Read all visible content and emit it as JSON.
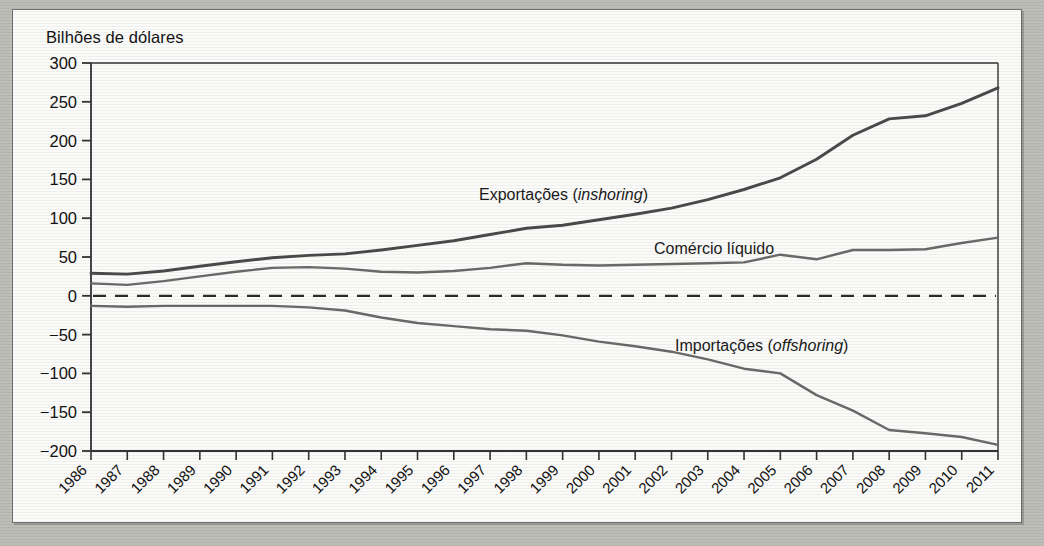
{
  "figure": {
    "axis_title": "Bilhões de dólares",
    "line_color_primary": "#4a4a4a",
    "line_color_secondary": "#6a6a6a",
    "axis_color": "#333333",
    "page_background": "#fbfbf9",
    "frame_background": "#bdbdb8"
  },
  "series_labels": [
    {
      "name": "exports",
      "text_main": "Exportações (",
      "text_italic": "inshoring",
      "text_tail": ")",
      "x": 466,
      "y": 190
    },
    {
      "name": "net-trade",
      "text_main": "Comércio líquido",
      "text_italic": "",
      "text_tail": "",
      "x": 641,
      "y": 244
    },
    {
      "name": "imports",
      "text_main": "Importações (",
      "text_italic": "offshoring",
      "text_tail": ")",
      "x": 662,
      "y": 341
    }
  ],
  "chart_data": {
    "type": "line",
    "title": "Bilhões de dólares",
    "xlabel": "",
    "ylabel": "Bilhões de dólares",
    "ylim": [
      -200,
      300
    ],
    "ytick_step": 50,
    "yticks": [
      "300",
      "250",
      "200",
      "150",
      "100",
      "50",
      "0",
      "−50",
      "−100",
      "−150",
      "−200"
    ],
    "grid": false,
    "legend": "inline-annotations",
    "zero_line": {
      "value": 0,
      "style": "dashed"
    },
    "categories": [
      "1986",
      "1987",
      "1988",
      "1989",
      "1990",
      "1991",
      "1992",
      "1993",
      "1994",
      "1995",
      "1996",
      "1997",
      "1998",
      "1999",
      "2000",
      "2001",
      "2002",
      "2003",
      "2004",
      "2005",
      "2006",
      "2007",
      "2008",
      "2009",
      "2010",
      "2011"
    ],
    "series": [
      {
        "name": "Exportações (inshoring)",
        "values": [
          29,
          28,
          32,
          38,
          44,
          49,
          52,
          54,
          59,
          65,
          71,
          79,
          87,
          91,
          98,
          105,
          113,
          124,
          137,
          152,
          176,
          207,
          228,
          232,
          248,
          268
        ]
      },
      {
        "name": "Comércio líquido",
        "values": [
          16,
          14,
          19,
          25,
          31,
          36,
          37,
          35,
          31,
          30,
          32,
          36,
          42,
          40,
          39,
          40,
          41,
          42,
          43,
          53,
          47,
          59,
          59,
          60,
          68,
          75
        ]
      },
      {
        "name": "Importações (offshoring)",
        "values": [
          -13,
          -14,
          -13,
          -13,
          -13,
          -13,
          -15,
          -19,
          -28,
          -35,
          -39,
          -43,
          -45,
          -51,
          -59,
          -65,
          -72,
          -82,
          -94,
          -100,
          -128,
          -148,
          -173,
          -177,
          -182,
          -192
        ]
      }
    ]
  }
}
